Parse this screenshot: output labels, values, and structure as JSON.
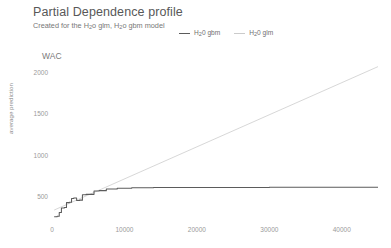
{
  "header": {
    "title": "Partial Dependence profile",
    "subtitle_prefix": "Created for the H",
    "subtitle_sub1": "2",
    "subtitle_mid": "o glm, H",
    "subtitle_sub2": "2",
    "subtitle_suffix": "o gbm model"
  },
  "panel": {
    "variable_label": "WAC"
  },
  "legend": {
    "items": [
      {
        "name_prefix": "H",
        "name_sub": "2",
        "name_suffix": "0 gbm",
        "color": "#5b5b5b"
      },
      {
        "name_prefix": "H",
        "name_sub": "2",
        "name_suffix": "0 glm",
        "color": "#c9c9c9"
      }
    ]
  },
  "axes": {
    "ylabel": "average prediction",
    "xlabel": "",
    "yticks": [
      2000,
      1500,
      1000,
      500
    ],
    "ytick_labels": [
      "2000",
      "1500",
      "1000",
      "500"
    ],
    "xticks": [
      0,
      10000,
      20000,
      30000,
      40000
    ],
    "xtick_labels": [
      "0",
      "10000",
      "20000",
      "30000",
      "40000"
    ]
  },
  "chart_data": {
    "type": "line",
    "title": "Partial Dependence profile",
    "subtitle": "Created for the H2o glm, H2o gbm model",
    "xlabel": "WAC",
    "ylabel": "average prediction",
    "xlim": [
      0,
      45000
    ],
    "ylim": [
      200,
      2150
    ],
    "grid": false,
    "legend_position": "top",
    "series": [
      {
        "name": "H20 gbm",
        "color": "#5b5b5b",
        "style": "step-solid",
        "x": [
          300,
          700,
          1000,
          1300,
          1700,
          2000,
          2400,
          2700,
          3000,
          3400,
          3800,
          4200,
          4700,
          5200,
          5800,
          6500,
          7500,
          9000,
          11000,
          14000,
          18000,
          24000,
          30000,
          36000,
          42000,
          45000
        ],
        "y": [
          250,
          255,
          300,
          355,
          360,
          420,
          425,
          470,
          475,
          445,
          450,
          515,
          520,
          520,
          560,
          565,
          585,
          595,
          600,
          602,
          603,
          604,
          605,
          605,
          606,
          606
        ]
      },
      {
        "name": "H20 glm",
        "color": "#d2d2d2",
        "style": "line",
        "x": [
          300,
          45000
        ],
        "y": [
          330,
          2065
        ]
      }
    ]
  }
}
